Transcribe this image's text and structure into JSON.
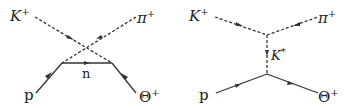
{
  "diagrams": [
    {
      "name": "u-channel neutron exchange",
      "labels": {
        "top_left": "K",
        "top_left_sup": "+",
        "top_right": "π",
        "top_right_sup": "+",
        "exchange": "n",
        "bottom_left": "p",
        "bottom_right": "Θ",
        "bottom_right_sup": "+"
      }
    },
    {
      "name": "t-channel K* exchange",
      "labels": {
        "top_left": "K",
        "top_left_sup": "+",
        "top_right": "π",
        "top_right_sup": "+",
        "exchange": "K",
        "exchange_sup": "*",
        "bottom_left": "p",
        "bottom_right": "Θ",
        "bottom_right_sup": "+"
      }
    }
  ],
  "colors": {
    "line": "#333333"
  }
}
